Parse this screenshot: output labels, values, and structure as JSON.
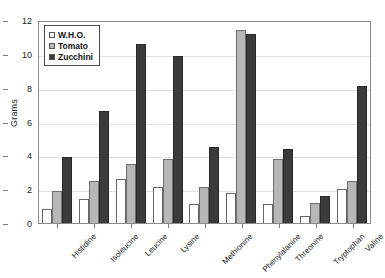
{
  "chart_data": {
    "type": "bar",
    "title": "",
    "xlabel": "",
    "ylabel": "Grams",
    "ylim": [
      0,
      12
    ],
    "yticks": [
      0,
      2,
      4,
      6,
      8,
      10,
      12
    ],
    "grid": true,
    "legend_position": "top-left",
    "categories": [
      "Histidine",
      "Isoleucine",
      "Leucine",
      "Lysine",
      "Methionine",
      "Phenylalanine",
      "Threonine",
      "Tryptophan",
      "Valine"
    ],
    "series": [
      {
        "name": "W.H.O.",
        "color": "#ffffff",
        "values": [
          0.8,
          1.4,
          2.6,
          2.1,
          1.1,
          1.8,
          1.1,
          0.4,
          2.0
        ]
      },
      {
        "name": "Tomato",
        "color": "#b7b7b7",
        "values": [
          1.9,
          2.5,
          3.5,
          3.8,
          2.1,
          11.4,
          3.8,
          1.2,
          2.5
        ]
      },
      {
        "name": "Zucchini",
        "color": "#3b3b3b",
        "values": [
          3.9,
          6.6,
          10.6,
          9.9,
          4.5,
          11.2,
          4.4,
          1.6,
          8.1
        ]
      }
    ]
  },
  "legend": {
    "items": [
      {
        "label": "W.H.O.",
        "swatch": "white-square-icon"
      },
      {
        "label": "Tomato",
        "swatch": "gray-square-icon"
      },
      {
        "label": "Zucchini",
        "swatch": "black-square-icon"
      }
    ]
  },
  "axes": {
    "y_title": "Grams",
    "y_tick_labels": [
      "12",
      "10",
      "8",
      "6",
      "4",
      "2",
      "0"
    ]
  }
}
